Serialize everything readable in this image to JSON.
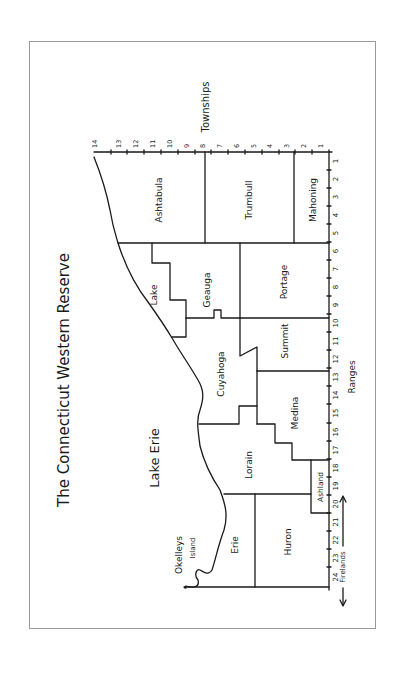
{
  "title": "The Connecticut Western Reserve",
  "water": {
    "lake": "Lake Erie",
    "island": [
      "Okelleys",
      "Island"
    ]
  },
  "axes": {
    "townships_label": "Townships",
    "ranges_label": "Ranges",
    "firelands_label": "Firelands",
    "townships": [
      "1",
      "2",
      "3",
      "4",
      "5",
      "6",
      "7",
      "8",
      "9",
      "10",
      "11",
      "12",
      "13",
      "14"
    ],
    "ranges": [
      "1",
      "2",
      "3",
      "4",
      "5",
      "6",
      "7",
      "8",
      "9",
      "10",
      "11",
      "12",
      "13",
      "14",
      "15",
      "16",
      "17",
      "18",
      "19",
      "20",
      "21",
      "22",
      "23",
      "24"
    ]
  },
  "counties": [
    {
      "name": "Ashtabula"
    },
    {
      "name": "Trumbull"
    },
    {
      "name": "Mahoning"
    },
    {
      "name": "Lake"
    },
    {
      "name": "Geauga"
    },
    {
      "name": "Portage"
    },
    {
      "name": "Cuyahoga"
    },
    {
      "name": "Summit"
    },
    {
      "name": "Medina"
    },
    {
      "name": "Lorain"
    },
    {
      "name": "Ashland"
    },
    {
      "name": "Erie"
    },
    {
      "name": "Huron"
    }
  ],
  "colors": {
    "ink": "#1a1a1a",
    "frame": "#9a9a9a",
    "paper": "#ffffff"
  }
}
